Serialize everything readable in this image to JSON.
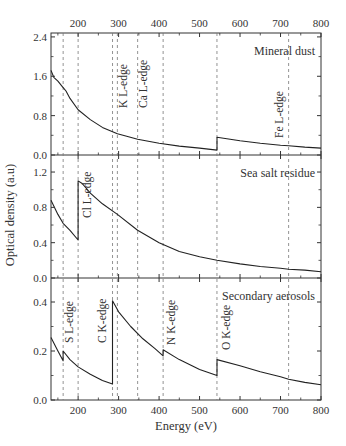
{
  "chart_data": {
    "type": "line",
    "layout": "three stacked panels sharing x-axis",
    "xlabel": "Energy (eV)",
    "ylabel": "Optical density (a.u)",
    "xlim": [
      133,
      800
    ],
    "x_ticks": [
      200,
      300,
      400,
      500,
      600,
      700,
      800
    ],
    "edge_lines_eV": [
      163,
      200,
      285,
      297,
      347,
      410,
      543,
      720
    ],
    "panels": [
      {
        "title": "Mineral dust",
        "ylim": [
          0,
          2.4
        ],
        "y_ticks": [
          "0.0",
          "0.8",
          "1.6",
          "2.4"
        ],
        "annotations": [
          "K L-edge",
          "Ca L-edge",
          "Fe L-edge"
        ],
        "series": {
          "x": [
            133,
            140,
            150,
            160,
            165,
            170,
            180,
            200,
            230,
            260,
            297,
            320,
            347,
            400,
            450,
            500,
            543,
            543,
            600,
            650,
            700,
            720,
            760,
            800
          ],
          "y": [
            1.72,
            1.58,
            1.5,
            1.4,
            1.35,
            1.3,
            1.15,
            0.92,
            0.72,
            0.56,
            0.43,
            0.38,
            0.32,
            0.24,
            0.18,
            0.14,
            0.1,
            0.36,
            0.29,
            0.24,
            0.2,
            0.19,
            0.16,
            0.14
          ]
        }
      },
      {
        "title": "Sea salt residue",
        "ylim": [
          0,
          1.3
        ],
        "y_ticks": [
          "0.0",
          "0.4",
          "0.8",
          "1.2"
        ],
        "annotations": [
          "Cl L-edge"
        ],
        "series": {
          "x": [
            133,
            150,
            163,
            180,
            200,
            200,
            210,
            230,
            260,
            297,
            347,
            400,
            450,
            500,
            543,
            600,
            650,
            700,
            720,
            760,
            800
          ],
          "y": [
            0.88,
            0.72,
            0.62,
            0.54,
            0.43,
            1.1,
            1.07,
            0.96,
            0.84,
            0.72,
            0.54,
            0.4,
            0.3,
            0.24,
            0.2,
            0.16,
            0.13,
            0.11,
            0.1,
            0.09,
            0.07
          ]
        }
      },
      {
        "title": "Secondary aerosols",
        "ylim": [
          0,
          0.5
        ],
        "y_ticks": [
          "0.0",
          "0.2",
          "0.4"
        ],
        "annotations": [
          "S L-edge",
          "C K-edge",
          "N K-edge",
          "O K-edge"
        ],
        "series": {
          "x": [
            133,
            150,
            163,
            163,
            180,
            200,
            230,
            260,
            285,
            285,
            300,
            330,
            360,
            390,
            410,
            410,
            450,
            500,
            543,
            543,
            600,
            650,
            700,
            720,
            760,
            800
          ],
          "y": [
            0.255,
            0.2,
            0.16,
            0.2,
            0.165,
            0.135,
            0.105,
            0.08,
            0.065,
            0.405,
            0.36,
            0.3,
            0.25,
            0.21,
            0.18,
            0.205,
            0.165,
            0.125,
            0.1,
            0.165,
            0.14,
            0.115,
            0.095,
            0.085,
            0.072,
            0.062
          ]
        }
      }
    ]
  }
}
